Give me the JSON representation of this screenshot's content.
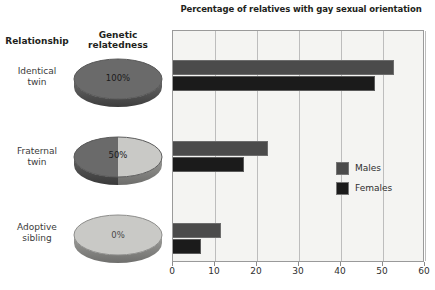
{
  "figure": {
    "title": "Percentage of relatives with gay sexual orientation",
    "columns": {
      "relationship": "Relationship",
      "relatedness_line1": "Genetic",
      "relatedness_line2": "relatedness"
    },
    "rows": [
      {
        "label_line1": "Identical",
        "label_line2": "twin",
        "relatedness_pct": "100%",
        "relatedness_value": 100
      },
      {
        "label_line1": "Fraternal",
        "label_line2": "twin",
        "relatedness_pct": "50%",
        "relatedness_value": 50
      },
      {
        "label_line1": "Adoptive",
        "label_line2": "sibling",
        "relatedness_pct": "0%",
        "relatedness_value": 0
      }
    ],
    "colors": {
      "males": "#4b4b4b",
      "females": "#1b1b1b",
      "pie_dark": "#6a6a6a",
      "pie_light": "#c9c9c6",
      "plot_background": "#f4f4f2",
      "gridline": "#bdbdbd"
    }
  },
  "chart_data": {
    "type": "bar",
    "orientation": "horizontal",
    "title": "Percentage of relatives with gay sexual orientation",
    "xlabel": "",
    "ylabel": "",
    "categories": [
      "Identical twin",
      "Fraternal twin",
      "Adoptive sibling"
    ],
    "series": [
      {
        "name": "Males",
        "values": [
          52.5,
          22.7,
          11.4
        ],
        "color": "#4b4b4b"
      },
      {
        "name": "Females",
        "values": [
          48.2,
          16.8,
          6.6
        ],
        "color": "#1b1b1b"
      }
    ],
    "xlim": [
      0,
      60
    ],
    "xticks": [
      0,
      10,
      20,
      30,
      40,
      50,
      60
    ],
    "xtick_labels": [
      "0",
      "10",
      "20",
      "30",
      "40",
      "50",
      "60"
    ],
    "grid": true,
    "grid_axis": "x",
    "legend_position": "center right",
    "legend": [
      "Males",
      "Females"
    ]
  },
  "legend": {
    "items": [
      {
        "label": "Males"
      },
      {
        "label": "Females"
      }
    ]
  }
}
